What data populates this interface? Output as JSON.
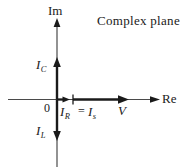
{
  "figure": {
    "title": "Complex plane",
    "background_color": "#ffffff",
    "stroke_color": "#1a1a1a",
    "width": 191,
    "height": 167
  },
  "axes": {
    "imaginary": {
      "label": "Im",
      "name": "imaginary-axis",
      "direction": "up"
    },
    "real": {
      "label": "Re",
      "name": "real-axis",
      "direction": "right"
    },
    "origin": {
      "label": "0"
    }
  },
  "vectors": [
    {
      "id": "ic",
      "name": "capacitive-current-vector",
      "symbol": "I",
      "subscript": "C",
      "direction": "up",
      "axis": "imaginary"
    },
    {
      "id": "il",
      "name": "inductive-current-vector",
      "symbol": "I",
      "subscript": "L",
      "direction": "down",
      "axis": "imaginary"
    },
    {
      "id": "ir",
      "name": "resistive-current-vector",
      "symbol": "I",
      "subscript": "R",
      "direction": "right",
      "axis": "real"
    },
    {
      "id": "is",
      "name": "source-current-vector",
      "symbol": "I",
      "subscript": "s",
      "direction": "right",
      "axis": "real"
    },
    {
      "id": "v",
      "name": "voltage-vector",
      "symbol": "V",
      "subscript": "",
      "direction": "right",
      "axis": "real"
    }
  ],
  "annotations": {
    "equality": "="
  }
}
